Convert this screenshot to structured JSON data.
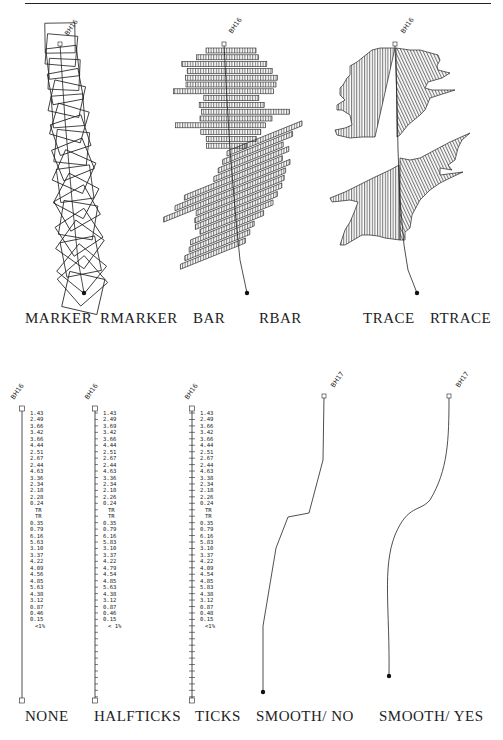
{
  "figure": {
    "top_row": {
      "borehole_label": "BH16",
      "captions": [
        "MARKER",
        "RMARKER",
        "BAR",
        "RBAR",
        "TRACE",
        "RTRACE"
      ],
      "panels": [
        {
          "id": "marker",
          "style": "rotated square markers along well path"
        },
        {
          "id": "bar",
          "style": "hatched bars perpendicular to well path"
        },
        {
          "id": "trace",
          "style": "hatched filled trace polygon along well path"
        }
      ]
    },
    "bottom_row": {
      "captions": [
        "NONE",
        "HALFTICKS",
        "TICKS",
        "SMOOTH/ NO",
        "SMOOTH/ YES"
      ],
      "annotation_columns": [
        {
          "id": "none",
          "borehole_label": "BH16",
          "values": [
            "1.43",
            "2.49",
            "3.66",
            "3.42",
            "3.66",
            "4.44",
            "2.51",
            "2.67",
            "2.44",
            "4.63",
            "3.36",
            "2.34",
            "2.18",
            "2.28",
            "0.24",
            "TR",
            "TR",
            "0.35",
            "0.79",
            "6.16",
            "5.63",
            "3.10",
            "3.37",
            "4.22",
            "4.09",
            "4.56",
            "4.85",
            "5.63",
            "4.38",
            "3.12",
            "0.87",
            "0.46",
            "0.15",
            "<1%"
          ]
        },
        {
          "id": "halfticks",
          "borehole_label": "BH16",
          "values": [
            "1.43",
            "2.49",
            "3.69",
            "3.42",
            "3.66",
            "4.44",
            "2.51",
            "2.67",
            "2.44",
            "4.63",
            "3.36",
            "2.34",
            "2.18",
            "2.26",
            "0.24",
            "TR",
            "TR",
            "0.35",
            "0.79",
            "6.16",
            "5.83",
            "3.10",
            "3.37",
            "4.22",
            "4.79",
            "4.54",
            "4.85",
            "5.63",
            "4.38",
            "3.12",
            "0.87",
            "0.46",
            "0.15",
            "< 1%"
          ]
        },
        {
          "id": "ticks",
          "borehole_label": "BH16",
          "values": [
            "1.43",
            "2.49",
            "3.66",
            "3.42",
            "3.66",
            "4.44",
            "2.51",
            "2.67",
            "2.44",
            "4.63",
            "3.38",
            "2.34",
            "2.18",
            "2.26",
            "0.24",
            "TR",
            "TR",
            "0.35",
            "0.79",
            "6.16",
            "5.83",
            "3.10",
            "3.37",
            "4.22",
            "4.09",
            "4.54",
            "4.85",
            "5.83",
            "4.38",
            "3.12",
            "0.87",
            "0.48",
            "0.15",
            "<1%"
          ]
        }
      ],
      "smooth_panels": [
        {
          "id": "smooth-no",
          "borehole_label": "BH17"
        },
        {
          "id": "smooth-yes",
          "borehole_label": "BH17"
        }
      ]
    },
    "colors": {
      "ink": "#1a1a1a",
      "paper": "#ffffff"
    }
  }
}
